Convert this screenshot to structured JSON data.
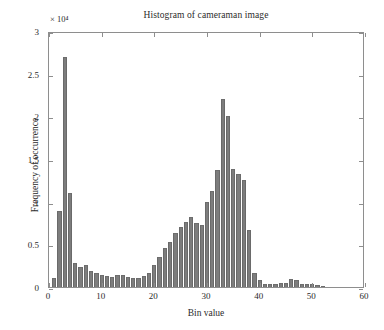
{
  "chart_data": {
    "type": "bar",
    "title": "Histogram of cameraman image",
    "xlabel": "Bin value",
    "ylabel": "Frequency of occurrence",
    "y_exponent_label": "× 10⁴",
    "xlim": [
      0,
      60
    ],
    "ylim": [
      0,
      30000
    ],
    "y_tick_values": [
      0,
      5000,
      10000,
      15000,
      20000,
      25000,
      30000
    ],
    "y_tick_labels": [
      "0",
      "0.5",
      "1",
      "1.5",
      "2",
      "2.5",
      "3"
    ],
    "x_tick_values": [
      0,
      10,
      20,
      30,
      40,
      50,
      60
    ],
    "x_tick_labels": [
      "0",
      "10",
      "20",
      "30",
      "40",
      "50",
      "60"
    ],
    "grid": false,
    "legend": null,
    "bar_color": "#7d7d7d",
    "axes_color": "#8e8e8e",
    "bar_width_bins": 0.82,
    "categories": [
      1,
      2,
      3,
      4,
      5,
      6,
      7,
      8,
      9,
      10,
      11,
      12,
      13,
      14,
      15,
      16,
      17,
      18,
      19,
      20,
      21,
      22,
      23,
      24,
      25,
      26,
      27,
      28,
      29,
      30,
      31,
      32,
      33,
      34,
      35,
      36,
      37,
      38,
      39,
      40,
      41,
      42,
      43,
      44,
      45,
      46,
      47,
      48,
      49,
      50,
      51,
      52
    ],
    "values": [
      1000,
      8900,
      27000,
      11000,
      2800,
      2300,
      2600,
      1900,
      1600,
      1400,
      1300,
      1200,
      1400,
      1400,
      1200,
      1100,
      1000,
      1300,
      1600,
      2600,
      3500,
      4600,
      5300,
      6300,
      7000,
      7600,
      8200,
      7500,
      7300,
      10000,
      11300,
      13700,
      22000,
      20000,
      13800,
      13200,
      12500,
      6700,
      1700,
      800,
      400,
      300,
      400,
      500,
      500,
      900,
      800,
      300,
      300,
      300,
      200,
      100
    ]
  }
}
